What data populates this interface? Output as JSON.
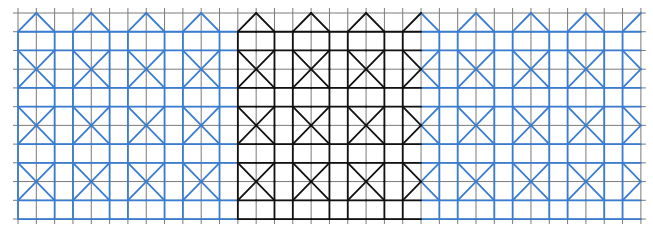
{
  "figure": {
    "width": 653,
    "height": 231
  },
  "grid": {
    "origin_x": 18,
    "origin_y": 13,
    "cell_w": 18.32,
    "cell_h": 18.73,
    "cols": 34,
    "rows": 11,
    "tick_overhang": 5,
    "color": "#7a7a7a"
  },
  "pattern": {
    "period_cols": 3,
    "x_center_col_offset": 1,
    "x_center_rows": [
      3,
      6,
      9
    ],
    "apex_row": 0,
    "horizontal_rows": [
      1,
      2,
      4,
      5,
      7,
      8,
      10,
      11
    ],
    "colors": {
      "blue": "#3a7dd0",
      "black": "#111111"
    },
    "highlight": {
      "col_start": 12,
      "col_end": 22,
      "color_key": "black"
    },
    "base_color_key": "blue"
  }
}
